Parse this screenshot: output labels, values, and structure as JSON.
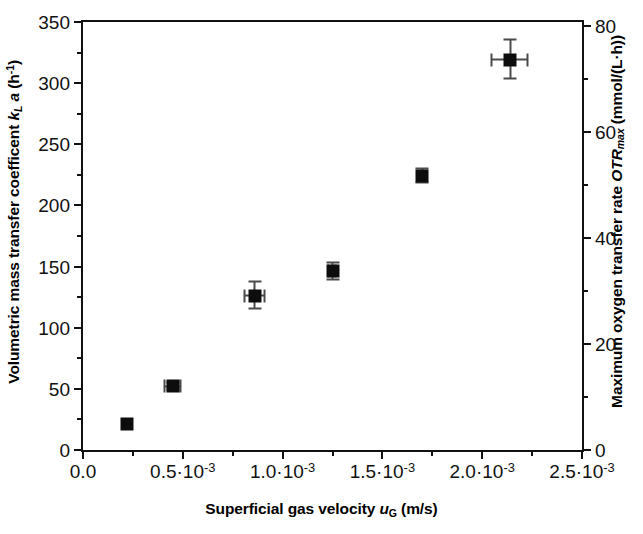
{
  "chart_data": {
    "type": "scatter",
    "title": "",
    "xlabel": "Superficial gas velocity u_G (m/s)",
    "ylabel": "Volumetric mass transfer coefficent k_L a (h^-1)",
    "y2label": "Maximum oxygen transfer rate OTR_max (mmol/(L·h))",
    "xlim": [
      0.0,
      0.0025
    ],
    "ylim": [
      0,
      350
    ],
    "y2lim": [
      0,
      80.8
    ],
    "grid": false,
    "legend": null,
    "x": [
      0.00022,
      0.00045,
      0.00086,
      0.00125,
      0.0017,
      0.00214
    ],
    "values": [
      21,
      52,
      126,
      146,
      224,
      319
    ],
    "values_y2": [
      4.8,
      11.9,
      28.8,
      33.4,
      51.2,
      72.9
    ],
    "yerr": [
      0,
      3,
      11,
      7,
      6,
      16
    ],
    "xerr": [
      0,
      4e-05,
      5e-05,
      2e-05,
      0,
      9e-05
    ],
    "series": [
      {
        "name": "kLa",
        "marker": "filled-square",
        "color": "#0d0d0d",
        "points": [
          {
            "x": 0.00022,
            "y": 21,
            "y2": 4.8,
            "yerr": 0,
            "xerr": 0
          },
          {
            "x": 0.00045,
            "y": 52,
            "y2": 11.9,
            "yerr": 3,
            "xerr": 4e-05
          },
          {
            "x": 0.00086,
            "y": 126,
            "y2": 28.8,
            "yerr": 11,
            "xerr": 5e-05
          },
          {
            "x": 0.00125,
            "y": 146,
            "y2": 33.4,
            "yerr": 7,
            "xerr": 2e-05
          },
          {
            "x": 0.0017,
            "y": 224,
            "y2": 51.2,
            "yerr": 6,
            "xerr": 0
          },
          {
            "x": 0.00214,
            "y": 319,
            "y2": 72.9,
            "yerr": 16,
            "xerr": 9e-05
          }
        ]
      }
    ],
    "x_ticks": [
      {
        "value": 0.0,
        "label": "0.0"
      },
      {
        "value": 0.0005,
        "label": "0.5·10",
        "exp": "-3"
      },
      {
        "value": 0.001,
        "label": "1.0·10",
        "exp": "-3"
      },
      {
        "value": 0.0015,
        "label": "1.5·10",
        "exp": "-3"
      },
      {
        "value": 0.002,
        "label": "2.0·10",
        "exp": "-3"
      },
      {
        "value": 0.0025,
        "label": "2.5·10",
        "exp": "-3"
      }
    ],
    "x_minor_ticks": [
      0.00025,
      0.00075,
      0.00125,
      0.00175,
      0.00225
    ],
    "y_ticks": [
      {
        "value": 0,
        "label": "0"
      },
      {
        "value": 50,
        "label": "50"
      },
      {
        "value": 100,
        "label": "100"
      },
      {
        "value": 150,
        "label": "150"
      },
      {
        "value": 200,
        "label": "200"
      },
      {
        "value": 250,
        "label": "250"
      },
      {
        "value": 300,
        "label": "300"
      },
      {
        "value": 350,
        "label": "350"
      }
    ],
    "y_minor_ticks": [
      25,
      75,
      125,
      175,
      225,
      275,
      325
    ],
    "y2_ticks": [
      {
        "value": 0,
        "label": "0"
      },
      {
        "value": 20,
        "label": "20"
      },
      {
        "value": 40,
        "label": "40"
      },
      {
        "value": 60,
        "label": "60"
      },
      {
        "value": 80,
        "label": "80"
      }
    ],
    "y2_minor_ticks": [
      10,
      30,
      50,
      70
    ]
  },
  "axes": {
    "y_left_title": {
      "text_1": "Volumetric mass transfer coefficent ",
      "symbol_k": "k",
      "symbol_k_sub": "L",
      "symbol_a": " a",
      "unit_open": " (h",
      "unit_exp": "-1",
      "unit_close": ")"
    },
    "y_right_title": {
      "text_1": "Maximum oxygen transfer rate ",
      "symbol": "OTR",
      "symbol_sub": "max",
      "unit": " (mmol/(L·h))"
    },
    "x_title": {
      "text_1": "Superficial gas velocity ",
      "symbol": "u",
      "symbol_sub": "G",
      "unit": " (m/s)"
    }
  }
}
